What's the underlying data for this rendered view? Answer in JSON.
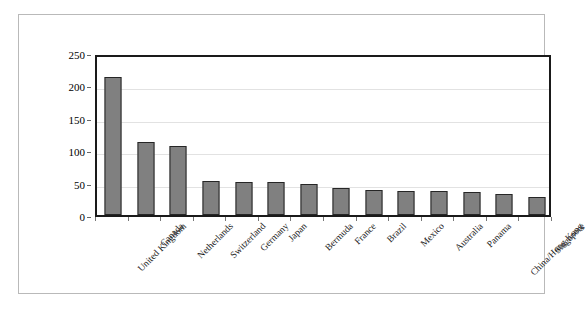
{
  "chart_data": {
    "type": "bar",
    "title": "",
    "subtitle": "",
    "xlabel": "",
    "ylabel": "",
    "ylim": [
      0,
      250
    ],
    "ytick_values": [
      0,
      50,
      100,
      150,
      200,
      250
    ],
    "ytick_labels": [
      "0",
      "50",
      "100",
      "150",
      "200",
      "250"
    ],
    "grid": true,
    "legend": false,
    "legend_position": "none",
    "bar_color": "#808080",
    "bar_edge_color": "#262626",
    "axis_color": "#1a1a1a",
    "gridline_color": "#e2e2e2",
    "frame_color": "#b9b9b9",
    "background_color": "#ffffff",
    "categories": [
      "United Kingdom",
      "Canada",
      "Netherlands",
      "Switzerland",
      "Germany",
      "Japan",
      "Bermuda",
      "France",
      "Brazil",
      "Mexico",
      "Australia",
      "Panama",
      "China/Hong Kong",
      "Singapore"
    ],
    "values": [
      213,
      112,
      107,
      52,
      51,
      51,
      48,
      42,
      38,
      37,
      37,
      36,
      32,
      28
    ]
  }
}
